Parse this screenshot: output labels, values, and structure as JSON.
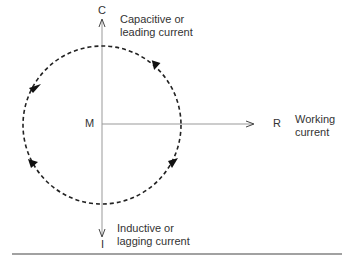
{
  "diagram": {
    "type": "phasor rotation diagram",
    "axis_labels": {
      "top": "C",
      "bottom": "I",
      "right": "R",
      "center": "M"
    },
    "annotations": {
      "capacitive_line1": "Capacitive or",
      "capacitive_line2": "leading current",
      "inductive_line1": "Inductive or",
      "inductive_line2": "lagging current",
      "working_line1": "Working",
      "working_line2": "current"
    },
    "rotation": "counter-clockwise",
    "colors": {
      "line": "#999999",
      "dashed_circle": "#222222"
    }
  }
}
